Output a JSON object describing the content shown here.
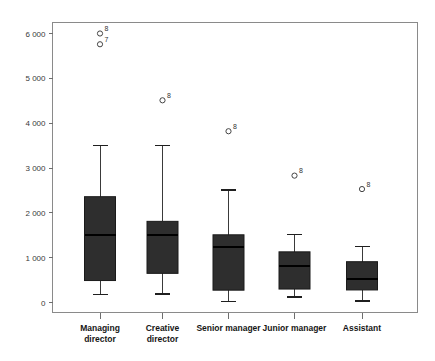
{
  "chart_data": {
    "type": "box",
    "title": "",
    "subtitle": "",
    "xlabel": "",
    "ylabel": "",
    "grid": false,
    "legend": "none",
    "ylim": [
      -300,
      6400
    ],
    "y_ticks": [
      0,
      1000,
      2000,
      3000,
      4000,
      5000,
      6000
    ],
    "y_tick_labels": [
      "0",
      "1 000",
      "2 000",
      "3 000",
      "4 000",
      "5 000",
      "6 000"
    ],
    "categories": [
      "Managing director",
      "Creative director",
      "Senior manager",
      "Junior manager",
      "Assistant"
    ],
    "category_lines": [
      [
        "Managing",
        "director"
      ],
      [
        "Creative",
        "director"
      ],
      [
        "Senior manager"
      ],
      [
        "Junior manager"
      ],
      [
        "Assistant"
      ]
    ],
    "boxes": [
      {
        "category": "Managing director",
        "whisker_low": 180,
        "q1": 490,
        "median": 1500,
        "q3": 2360,
        "whisker_high": 3500,
        "outliers": [
          {
            "value": 6000,
            "label": "8"
          },
          {
            "value": 5760,
            "label": "7"
          }
        ]
      },
      {
        "category": "Creative director",
        "whisker_low": 190,
        "q1": 650,
        "median": 1500,
        "q3": 1810,
        "whisker_high": 3500,
        "outliers": [
          {
            "value": 4510,
            "label": "8"
          }
        ]
      },
      {
        "category": "Senior manager",
        "whisker_low": 20,
        "q1": 275,
        "median": 1230,
        "q3": 1510,
        "whisker_high": 2510,
        "outliers": [
          {
            "value": 3820,
            "label": "8"
          }
        ]
      },
      {
        "category": "Junior manager",
        "whisker_low": 125,
        "q1": 300,
        "median": 820,
        "q3": 1130,
        "whisker_high": 1520,
        "outliers": [
          {
            "value": 2830,
            "label": "8"
          }
        ]
      },
      {
        "category": "Assistant",
        "whisker_low": 30,
        "q1": 280,
        "median": 520,
        "q3": 910,
        "whisker_high": 1250,
        "outliers": [
          {
            "value": 2530,
            "label": "8"
          }
        ]
      }
    ],
    "colors": {
      "box_fill": "#2e2e2e",
      "box_stroke": "#1a1a1a",
      "median": "#000000",
      "whisker": "#3a3a3a",
      "outlier_stroke": "#444444",
      "axis": "#8a8a8a",
      "tick_label": "#3a3a3a",
      "category_label": "#161616",
      "background": "#ffffff"
    }
  }
}
